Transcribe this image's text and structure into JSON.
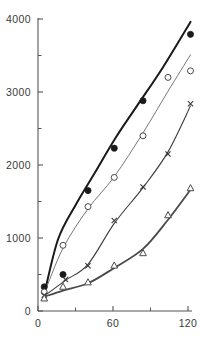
{
  "chart_data": {
    "type": "scatter",
    "title": "",
    "subtitle": "",
    "xlabel": "",
    "ylabel": "",
    "xlim": [
      0,
      128
    ],
    "ylim": [
      0,
      4000
    ],
    "grid": false,
    "legend": "none",
    "x_ticks_major": [
      0,
      60,
      120
    ],
    "x_tick_labels": [
      "0",
      "60",
      "120"
    ],
    "x_ticks_minor": [
      30,
      90
    ],
    "y_ticks_major": [
      0,
      1000,
      2000,
      3000,
      4000
    ],
    "y_tick_labels": [
      "0",
      "1000",
      "2000",
      "3000",
      "4000"
    ],
    "y_ticks_minor": [
      500,
      1500,
      2500,
      3500
    ],
    "series": [
      {
        "name": "filled-circle",
        "marker": "filled-circle",
        "color": "#1a1a1a",
        "line_width": 2.0,
        "x": [
          5,
          20,
          40,
          61,
          84,
          122
        ],
        "y": [
          330,
          500,
          1650,
          2230,
          2880,
          3790
        ],
        "curve_x": [
          5,
          16,
          30,
          45,
          62,
          80,
          100,
          122
        ],
        "curve_y": [
          230,
          980,
          1450,
          1880,
          2370,
          2830,
          3340,
          3960
        ]
      },
      {
        "name": "open-circle",
        "marker": "open-circle",
        "color": "#777777",
        "line_width": 1.0,
        "x": [
          5,
          20,
          40,
          61,
          84,
          104,
          122
        ],
        "y": [
          260,
          900,
          1430,
          1830,
          2400,
          3200,
          3290
        ],
        "curve_x": [
          5,
          20,
          40,
          61,
          84,
          104,
          122
        ],
        "curve_y": [
          240,
          860,
          1400,
          1840,
          2440,
          3010,
          3510
        ]
      },
      {
        "name": "cross",
        "marker": "cross",
        "color": "#3a3a3a",
        "line_width": 1.1,
        "x": [
          5,
          22,
          40,
          61,
          84,
          104,
          122
        ],
        "y": [
          215,
          430,
          620,
          1240,
          1700,
          2150,
          2840
        ],
        "curve_x": [
          5,
          22,
          40,
          61,
          84,
          104,
          122
        ],
        "curve_y": [
          205,
          420,
          640,
          1200,
          1690,
          2180,
          2810
        ]
      },
      {
        "name": "open-triangle",
        "marker": "open-triangle",
        "color": "#4a4a4a",
        "line_width": 1.8,
        "x": [
          5,
          20,
          40,
          61,
          84,
          104,
          122
        ],
        "y": [
          170,
          330,
          390,
          620,
          790,
          1310,
          1680
        ],
        "curve_x": [
          5,
          20,
          40,
          61,
          84,
          104,
          122
        ],
        "curve_y": [
          195,
          280,
          380,
          590,
          850,
          1250,
          1660
        ]
      }
    ]
  },
  "axes": {
    "y_axis_name": "y-axis",
    "x_axis_name": "x-axis"
  }
}
